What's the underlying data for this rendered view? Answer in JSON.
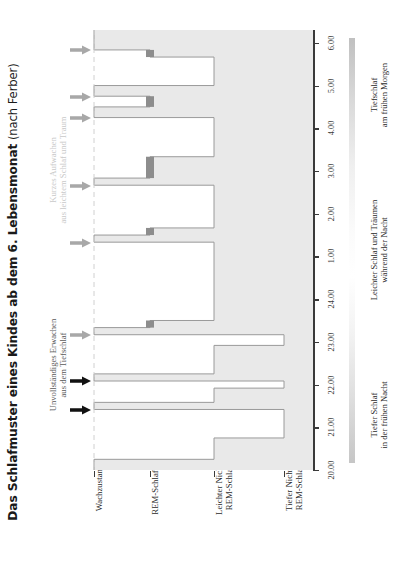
{
  "title": {
    "main": "Das Schlafmuster eines Kindes ab dem 6. Lebensmonat",
    "sub": " (nach Ferber)"
  },
  "annotations": [
    {
      "name": "short-awakening",
      "color": "#c9c9c9",
      "lines": [
        "Kurzes Aufwachen",
        "aus leichtem Schlaf und Traum"
      ]
    },
    {
      "name": "partial-arousal",
      "color": "#5a5a5a",
      "lines": [
        "Unvollständiges Erwachen",
        "aus dem Tiefschlaf"
      ]
    }
  ],
  "categories": [
    {
      "lines": [
        "Wachzustand"
      ],
      "swatch": false
    },
    {
      "lines": [
        "REM-Schlaf"
      ],
      "swatch": true
    },
    {
      "lines": [
        "Leichter Nicht-",
        "REM-Schlaf"
      ],
      "swatch": false
    },
    {
      "lines": [
        "Tiefer Nicht-",
        "REM-Schlaf"
      ],
      "swatch": false
    }
  ],
  "time_ticks": [
    "20.00",
    "21.00",
    "22.00",
    "23.00",
    "24.00",
    "1.00",
    "2.00",
    "3.00",
    "4.00",
    "5.00",
    "6.00"
  ],
  "gradient_legend": [
    {
      "lines": [
        "Tiefer Schlaf",
        "in der frühen Nacht"
      ]
    },
    {
      "lines": [
        "Leichter Schlaf und Träumen",
        "während der Nacht"
      ]
    },
    {
      "lines": [
        "Tiefschlaf",
        "am frühen Morgen"
      ]
    }
  ],
  "colors": {
    "plot_background": "#e9e9e9",
    "curve_fill": "#ffffff",
    "curve_stroke": "#9a9a9a",
    "rem_marker": "#8d8d8d",
    "arrow_light": "#a8a8a8",
    "arrow_dark": "#111111",
    "dashed_guide": "#d0d0d0",
    "axis": "#3a3a3a"
  },
  "chart_data": {
    "type": "line",
    "title": "Das Schlafmuster eines Kindes ab dem 6. Lebensmonat (nach Ferber)",
    "xlabel": "",
    "ylabel": "",
    "orientation": "rotated-90ccw",
    "grid": false,
    "legend": "right-gradient-bar",
    "x": [
      "20.00",
      "21.00",
      "22.00",
      "23.00",
      "24.00",
      "1.00",
      "2.00",
      "3.00",
      "4.00",
      "5.00",
      "6.00"
    ],
    "xlim": [
      "20.00",
      "6.25"
    ],
    "y_levels": [
      "Wachzustand",
      "REM-Schlaf",
      "Leichter Nicht-REM-Schlaf",
      "Tiefer Nicht-REM-Schlaf"
    ],
    "series": [
      {
        "name": "Schlafstadium",
        "stages": [
          {
            "from": "20.00",
            "to": "20.15",
            "stage": "Wachzustand"
          },
          {
            "from": "20.15",
            "to": "20.45",
            "stage": "Leichter Nicht-REM-Schlaf"
          },
          {
            "from": "20.45",
            "to": "21.25",
            "stage": "Tiefer Nicht-REM-Schlaf"
          },
          {
            "from": "21.25",
            "to": "21.35",
            "stage": "Wachzustand"
          },
          {
            "from": "21.35",
            "to": "21.55",
            "stage": "Leichter Nicht-REM-Schlaf"
          },
          {
            "from": "21.55",
            "to": "22.05",
            "stage": "Tiefer Nicht-REM-Schlaf"
          },
          {
            "from": "22.05",
            "to": "22.15",
            "stage": "Wachzustand"
          },
          {
            "from": "22.15",
            "to": "22.55",
            "stage": "Leichter Nicht-REM-Schlaf"
          },
          {
            "from": "22.55",
            "to": "23.10",
            "stage": "Tiefer Nicht-REM-Schlaf"
          },
          {
            "from": "23.10",
            "to": "23.20",
            "stage": "Wachzustand"
          },
          {
            "from": "23.20",
            "to": "23.30",
            "stage": "REM-Schlaf"
          },
          {
            "from": "23.30",
            "to": "01.20",
            "stage": "Leichter Nicht-REM-Schlaf"
          },
          {
            "from": "01.20",
            "to": "01.30",
            "stage": "Wachzustand"
          },
          {
            "from": "01.30",
            "to": "01.40",
            "stage": "REM-Schlaf"
          },
          {
            "from": "01.40",
            "to": "02.40",
            "stage": "Leichter Nicht-REM-Schlaf"
          },
          {
            "from": "02.40",
            "to": "02.50",
            "stage": "Wachzustand"
          },
          {
            "from": "02.50",
            "to": "03.20",
            "stage": "REM-Schlaf"
          },
          {
            "from": "03.20",
            "to": "04.15",
            "stage": "Leichter Nicht-REM-Schlaf"
          },
          {
            "from": "04.15",
            "to": "04.30",
            "stage": "Wachzustand"
          },
          {
            "from": "04.30",
            "to": "04.45",
            "stage": "REM-Schlaf"
          },
          {
            "from": "04.45",
            "to": "05.00",
            "stage": "Wachzustand"
          },
          {
            "from": "05.00",
            "to": "05.40",
            "stage": "Leichter Nicht-REM-Schlaf"
          },
          {
            "from": "05.40",
            "to": "05.50",
            "stage": "REM-Schlaf"
          },
          {
            "from": "05.50",
            "to": "06.00",
            "stage": "Wachzustand"
          },
          {
            "from": "06.00",
            "to": "06.25",
            "stage": "Wachzustand"
          }
        ]
      }
    ],
    "markers": {
      "arousal_arrows": [
        {
          "time": "21.30",
          "type": "dark",
          "note": "Unvollständiges Erwachen aus dem Tiefschlaf"
        },
        {
          "time": "22.10",
          "type": "dark",
          "note": "Unvollständiges Erwachen aus dem Tiefschlaf"
        },
        {
          "time": "23.15",
          "type": "light",
          "note": "Kurzes Aufwachen"
        },
        {
          "time": "01.25",
          "type": "light",
          "note": "Kurzes Aufwachen aus leichtem Schlaf und Traum"
        },
        {
          "time": "02.45",
          "type": "light",
          "note": "Kurzes Aufwachen aus leichtem Schlaf und Traum"
        },
        {
          "time": "04.20",
          "type": "light",
          "note": "Kurzes Aufwachen aus leichtem Schlaf und Traum"
        },
        {
          "time": "04.50",
          "type": "light",
          "note": "Kurzes Aufwachen aus leichtem Schlaf und Traum"
        },
        {
          "time": "05.55",
          "type": "light",
          "note": "Kurzes Aufwachen aus leichtem Schlaf und Traum"
        }
      ]
    }
  }
}
